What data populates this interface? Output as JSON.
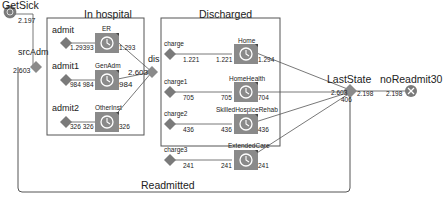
{
  "diagram": {
    "source": {
      "label": "GetSick",
      "value": "2.197"
    },
    "select_admission": {
      "label": "srcAdm",
      "value": "2.603"
    },
    "groups": {
      "in_hospital": {
        "label": "In hospital"
      },
      "discharged": {
        "label": "Discharged"
      }
    },
    "admission_branches": [
      {
        "label": "admit",
        "in_value": "1.29393",
        "node": "ER",
        "out_value": "1.293"
      },
      {
        "label": "admit1",
        "in_value": "984 984",
        "node": "GenAdm",
        "out_value": "984"
      },
      {
        "label": "admit2",
        "in_value": "326 326",
        "node": "OtherInst",
        "out_value": "326"
      }
    ],
    "discharge_select": {
      "label": "dis",
      "value": "2.603"
    },
    "discharge_branches": [
      {
        "label": "charge",
        "in_value": "1.221",
        "in_value2": "1.221",
        "node": "Home",
        "out_value": "1.294"
      },
      {
        "label": "charge1",
        "in_value": "705",
        "in_value2": "705",
        "node": "HomeHealth",
        "out_value": "704"
      },
      {
        "label": "charge2",
        "in_value": "436",
        "in_value2": "436",
        "node": "SkilledHospiceRehab",
        "out_value": "436"
      },
      {
        "label": "charge3",
        "in_value": "241",
        "in_value2": "241",
        "node": "ExtendedCare",
        "out_value": "241"
      }
    ],
    "last_state": {
      "label": "LastState",
      "in_value": "2.603",
      "out_value": "2.198",
      "loop_value": "406"
    },
    "sink": {
      "label": "noReadmit30",
      "value": "2.198"
    },
    "loop": {
      "label": "Readmitted"
    }
  },
  "colors": {
    "node_fill": "#8a8a8a",
    "line": "#555555",
    "group_border": "#555555"
  }
}
